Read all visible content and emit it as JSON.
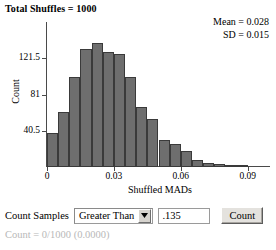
{
  "title": "Total Shuffles = 1000",
  "stats": {
    "mean_line": "Mean = 0.028",
    "sd_line": "SD = 0.015"
  },
  "chart_data": {
    "type": "bar",
    "title": "Total Shuffles = 1000",
    "xlabel": "Shuffled MADs",
    "ylabel": "Count",
    "xlim": [
      0,
      0.1
    ],
    "ylim": [
      0,
      162
    ],
    "grid": false,
    "legend": null,
    "xticks": [
      0,
      0.03,
      0.06,
      0.09
    ],
    "xtick_labels": [
      "0",
      "0.03",
      "0.06",
      "0.09"
    ],
    "yticks": [
      40.5,
      81,
      121.5
    ],
    "ytick_labels": [
      "40.5",
      "81",
      "121.5"
    ],
    "bin_width": 0.005,
    "bin_starts": [
      0.0,
      0.005,
      0.01,
      0.015,
      0.02,
      0.025,
      0.03,
      0.035,
      0.04,
      0.045,
      0.05,
      0.055,
      0.06,
      0.065,
      0.07,
      0.075,
      0.08,
      0.085
    ],
    "values": [
      38,
      62,
      101,
      132,
      138,
      129,
      126,
      101,
      67,
      54,
      30,
      26,
      18,
      8,
      5,
      3,
      2,
      1
    ],
    "annotations": [
      "Mean = 0.028",
      "SD = 0.015"
    ]
  },
  "controls": {
    "count_samples_label": "Count Samples",
    "comparison_selected": "Greater Than",
    "comparison_options": [
      "Greater Than"
    ],
    "value": ".135",
    "count_button_label": "Count"
  },
  "status": "Count = 0/1000 (0.0000)"
}
